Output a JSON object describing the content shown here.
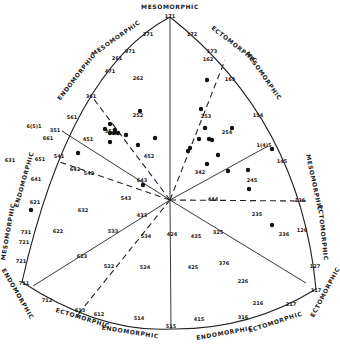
{
  "figure": {
    "type": "somatotype-chart",
    "colors": {
      "ink": "#1a1a1a",
      "background": "#ffffff"
    },
    "vertices": {
      "top": {
        "code": "171",
        "label": "MESOMORPHIC"
      },
      "left": {
        "code": "711",
        "label": "ENDOMORPHIC"
      },
      "right": {
        "code": "117",
        "label": "ECTOMORPHIC"
      }
    },
    "edge_labels": {
      "upper_left_a": "ENDOMORPHIC",
      "upper_left_b": "MESOMORPHIC",
      "upper_right_a": "ECTOMORPHIC",
      "upper_right_b": "MESOMORPHIC",
      "left_a": "MESOMORPHIC",
      "left_b": "ENDOMORPHIC",
      "left_bottom": "ENDOMORPHIC",
      "right_a": "MESOMORPHIC",
      "right_b": "ECTOMORPHIC",
      "right_bottom": "ECTOMORPHIC",
      "bottom_left_a": "ECTOMORPHIC",
      "bottom_left_b": "ENDOMORPHIC",
      "bottom_right_a": "ENDOMORPHIC",
      "bottom_right_b": "ECTOMORPHIC"
    },
    "center_code": "444"
  },
  "chart_data": {
    "type": "scatter",
    "title": "",
    "axes": [
      "Endomorphy",
      "Mesomorphy",
      "Ectomorphy"
    ],
    "grid_codes": [
      {
        "code": "171",
        "x": 170,
        "y": 17
      },
      {
        "code": "271",
        "x": 148,
        "y": 35
      },
      {
        "code": "172",
        "x": 192,
        "y": 35
      },
      {
        "code": "371",
        "x": 130,
        "y": 52
      },
      {
        "code": "173",
        "x": 212,
        "y": 52
      },
      {
        "code": "471",
        "x": 110,
        "y": 72
      },
      {
        "code": "261",
        "x": 117,
        "y": 59
      },
      {
        "code": "162",
        "x": 208,
        "y": 60
      },
      {
        "code": "262",
        "x": 138,
        "y": 79
      },
      {
        "code": "361",
        "x": 91,
        "y": 97
      },
      {
        "code": "163",
        "x": 230,
        "y": 80
      },
      {
        "code": "561",
        "x": 72,
        "y": 118
      },
      {
        "code": "451",
        "x": 88,
        "y": 140
      },
      {
        "code": "252",
        "x": 138,
        "y": 116
      },
      {
        "code": "253",
        "x": 206,
        "y": 117
      },
      {
        "code": "154",
        "x": 258,
        "y": 116
      },
      {
        "code": "6(5)1",
        "x": 34,
        "y": 127
      },
      {
        "code": "661",
        "x": 48,
        "y": 139
      },
      {
        "code": "351",
        "x": 55,
        "y": 131
      },
      {
        "code": "352",
        "x": 110,
        "y": 132
      },
      {
        "code": "254",
        "x": 227,
        "y": 133
      },
      {
        "code": "1(4)5",
        "x": 264,
        "y": 146
      },
      {
        "code": "651",
        "x": 40,
        "y": 160
      },
      {
        "code": "541",
        "x": 59,
        "y": 157
      },
      {
        "code": "452",
        "x": 149,
        "y": 157
      },
      {
        "code": "145",
        "x": 282,
        "y": 162
      },
      {
        "code": "631",
        "x": 10,
        "y": 161
      },
      {
        "code": "642",
        "x": 75,
        "y": 170
      },
      {
        "code": "342",
        "x": 200,
        "y": 173
      },
      {
        "code": "245",
        "x": 252,
        "y": 181
      },
      {
        "code": "542",
        "x": 89,
        "y": 174
      },
      {
        "code": "643",
        "x": 142,
        "y": 181
      },
      {
        "code": "641",
        "x": 36,
        "y": 180
      },
      {
        "code": "543",
        "x": 126,
        "y": 199
      },
      {
        "code": "444",
        "x": 213,
        "y": 200
      },
      {
        "code": "136",
        "x": 300,
        "y": 201
      },
      {
        "code": "621",
        "x": 35,
        "y": 203
      },
      {
        "code": "632",
        "x": 83,
        "y": 211
      },
      {
        "code": "433",
        "x": 142,
        "y": 216
      },
      {
        "code": "235",
        "x": 257,
        "y": 215
      },
      {
        "code": "731",
        "x": 26,
        "y": 233
      },
      {
        "code": "533",
        "x": 113,
        "y": 232
      },
      {
        "code": "534",
        "x": 146,
        "y": 237
      },
      {
        "code": "424",
        "x": 172,
        "y": 235
      },
      {
        "code": "435",
        "x": 196,
        "y": 237
      },
      {
        "code": "325",
        "x": 218,
        "y": 233
      },
      {
        "code": "236",
        "x": 284,
        "y": 235
      },
      {
        "code": "126",
        "x": 302,
        "y": 231
      },
      {
        "code": "721",
        "x": 24,
        "y": 243
      },
      {
        "code": "622",
        "x": 58,
        "y": 232
      },
      {
        "code": "623",
        "x": 82,
        "y": 257
      },
      {
        "code": "522",
        "x": 109,
        "y": 267
      },
      {
        "code": "524",
        "x": 145,
        "y": 268
      },
      {
        "code": "425",
        "x": 193,
        "y": 268
      },
      {
        "code": "226",
        "x": 243,
        "y": 282
      },
      {
        "code": "376",
        "x": 224,
        "y": 264
      },
      {
        "code": "721b",
        "x": 21,
        "y": 262
      },
      {
        "code": "711",
        "x": 24,
        "y": 284
      },
      {
        "code": "712",
        "x": 47,
        "y": 301
      },
      {
        "code": "613",
        "x": 80,
        "y": 311
      },
      {
        "code": "612",
        "x": 99,
        "y": 315
      },
      {
        "code": "514",
        "x": 139,
        "y": 319
      },
      {
        "code": "515",
        "x": 171,
        "y": 327
      },
      {
        "code": "415",
        "x": 199,
        "y": 320
      },
      {
        "code": "316",
        "x": 243,
        "y": 318
      },
      {
        "code": "216",
        "x": 258,
        "y": 304
      },
      {
        "code": "217",
        "x": 291,
        "y": 305
      },
      {
        "code": "117",
        "x": 316,
        "y": 291
      },
      {
        "code": "127",
        "x": 315,
        "y": 267
      }
    ],
    "points": [
      {
        "x": 110,
        "y": 124
      },
      {
        "x": 205,
        "y": 128
      },
      {
        "x": 105,
        "y": 129
      },
      {
        "x": 110,
        "y": 133
      },
      {
        "x": 114,
        "y": 133
      },
      {
        "x": 118,
        "y": 133
      },
      {
        "x": 115,
        "y": 130
      },
      {
        "x": 126,
        "y": 135
      },
      {
        "x": 110,
        "y": 142
      },
      {
        "x": 138,
        "y": 145
      },
      {
        "x": 155,
        "y": 138
      },
      {
        "x": 199,
        "y": 139
      },
      {
        "x": 209,
        "y": 139
      },
      {
        "x": 212,
        "y": 140
      },
      {
        "x": 188,
        "y": 151
      },
      {
        "x": 218,
        "y": 155
      },
      {
        "x": 190,
        "y": 148
      },
      {
        "x": 232,
        "y": 128
      },
      {
        "x": 207,
        "y": 164
      },
      {
        "x": 228,
        "y": 171
      },
      {
        "x": 248,
        "y": 170
      },
      {
        "x": 249,
        "y": 189
      },
      {
        "x": 78,
        "y": 153
      },
      {
        "x": 143,
        "y": 185
      },
      {
        "x": 272,
        "y": 149
      },
      {
        "x": 31,
        "y": 210
      },
      {
        "x": 272,
        "y": 225
      },
      {
        "x": 201,
        "y": 109
      },
      {
        "x": 207,
        "y": 80
      },
      {
        "x": 140,
        "y": 111
      }
    ]
  }
}
